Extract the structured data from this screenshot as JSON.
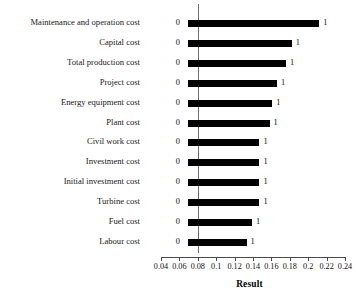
{
  "chart_data": {
    "type": "bar",
    "orientation": "horizontal",
    "title": "",
    "xlabel": "Result",
    "ylabel": "",
    "xlim": [
      0.04,
      0.24
    ],
    "xticks": [
      "0.04",
      "0.06",
      "0.08",
      "0.1",
      "0.12",
      "0.14",
      "0.16",
      "0.18",
      "0.2",
      "0.22",
      "0.24"
    ],
    "grid": false,
    "baseline": 0.08,
    "bar_start": 0.069,
    "legend": "none",
    "categories": [
      "Maintenance and operation cost",
      "Capital cost",
      "Total production cost",
      "Project cost",
      "Energy equipment cost",
      "Plant cost",
      "Civil work cost",
      "Investment cost",
      "Initial investment cost",
      "Turbine cost",
      "Fuel cost",
      "Labour cost"
    ],
    "values": [
      0.212,
      0.182,
      0.176,
      0.166,
      0.161,
      0.158,
      0.147,
      0.147,
      0.147,
      0.147,
      0.139,
      0.133
    ],
    "left_labels": [
      "0",
      "0",
      "0",
      "0",
      "0",
      "0",
      "0",
      "0",
      "0",
      "0",
      "0",
      "0"
    ],
    "right_labels": [
      "1",
      "1",
      "1",
      "1",
      "1",
      "1",
      "1",
      "1",
      "1",
      "1",
      "1",
      "1"
    ],
    "colors": {
      "bar": "#000000",
      "axis": "#4a4a4a",
      "gridline": "#6f6f6f",
      "background": "#ffffff",
      "text": "#111111"
    }
  }
}
